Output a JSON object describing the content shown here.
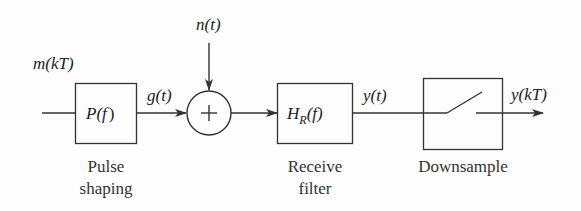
{
  "diagram": {
    "type": "block-diagram",
    "signals": {
      "input": "m(kT)",
      "after_pulse_shaping": "g(t)",
      "noise": "n(t)",
      "after_receive_filter": "y(t)",
      "output": "y(kT)"
    },
    "blocks": [
      {
        "id": "pulse-shaping",
        "symbol_main": "P(",
        "symbol_var": "f",
        "symbol_close": ")",
        "caption_line1": "Pulse",
        "caption_line2": "shaping"
      },
      {
        "id": "adder",
        "symbol": "+"
      },
      {
        "id": "receive-filter",
        "symbol_main": "H",
        "symbol_sub": "R",
        "symbol_rest": "(f)",
        "caption_line1": "Receive",
        "caption_line2": "filter"
      },
      {
        "id": "downsample",
        "symbol": "switch",
        "caption_line1": "Downsample"
      }
    ],
    "colors": {
      "line": "#333333",
      "text": "#222222",
      "background": "#fdfdfd"
    }
  }
}
